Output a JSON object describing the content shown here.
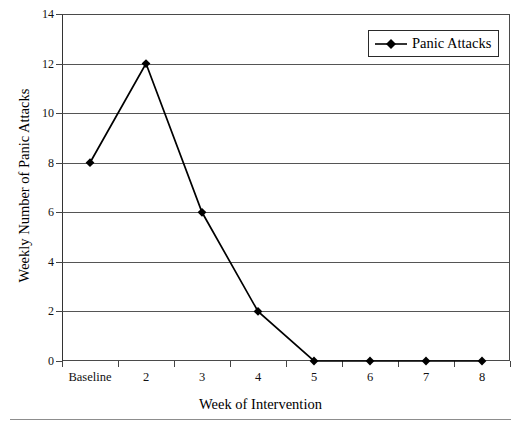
{
  "chart_data": {
    "type": "line",
    "title": "",
    "xlabel": "Week of Intervention",
    "ylabel": "Weekly Number of Panic Attacks",
    "categories": [
      "Baseline",
      "2",
      "3",
      "4",
      "5",
      "6",
      "7",
      "8"
    ],
    "series": [
      {
        "name": "Panic Attacks",
        "values": [
          8,
          12,
          6,
          2,
          0,
          0,
          0,
          0
        ],
        "marker": "filled-diamond",
        "color": "#000000"
      }
    ],
    "ylim": [
      0,
      14
    ],
    "ytick_values": [
      0,
      2,
      4,
      6,
      8,
      10,
      12,
      14
    ],
    "ytick_labels": [
      "0",
      "2",
      "4",
      "6",
      "8",
      "10",
      "12",
      "14"
    ],
    "grid": "horizontal",
    "legend_position": "top-right",
    "legend_entries": [
      "Panic Attacks"
    ]
  },
  "legend": {
    "label": "Panic Attacks",
    "marker_icon": "filled-diamond-marker-icon"
  },
  "axes": {
    "y_title": "Weekly Number of Panic Attacks",
    "x_title": "Week of Intervention"
  },
  "colors": {
    "series": "#000000",
    "gridline": "#555555",
    "frame": "#4a4a4a",
    "axis": "#333333",
    "background": "#ffffff",
    "rule": "#8d8d8d"
  }
}
